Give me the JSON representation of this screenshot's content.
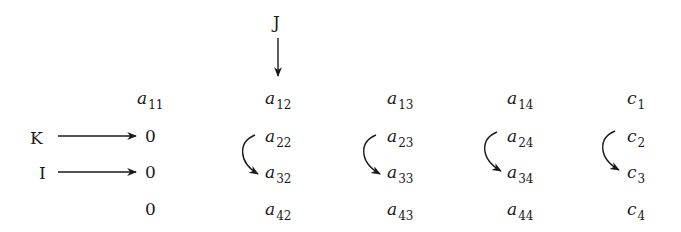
{
  "labels": {
    "J": "J",
    "K": "K",
    "I": "I"
  },
  "matrix": {
    "rows": [
      [
        {
          "base": "a",
          "sub": "11"
        },
        {
          "base": "a",
          "sub": "12"
        },
        {
          "base": "a",
          "sub": "13"
        },
        {
          "base": "a",
          "sub": "14"
        },
        {
          "base": "c",
          "sub": "1"
        }
      ],
      [
        {
          "base": "0",
          "sub": ""
        },
        {
          "base": "a",
          "sub": "22"
        },
        {
          "base": "a",
          "sub": "23"
        },
        {
          "base": "a",
          "sub": "24"
        },
        {
          "base": "c",
          "sub": "2"
        }
      ],
      [
        {
          "base": "0",
          "sub": ""
        },
        {
          "base": "a",
          "sub": "32"
        },
        {
          "base": "a",
          "sub": "33"
        },
        {
          "base": "a",
          "sub": "34"
        },
        {
          "base": "c",
          "sub": "3"
        }
      ],
      [
        {
          "base": "0",
          "sub": ""
        },
        {
          "base": "a",
          "sub": "42"
        },
        {
          "base": "a",
          "sub": "43"
        },
        {
          "base": "a",
          "sub": "44"
        },
        {
          "base": "c",
          "sub": "4"
        }
      ]
    ]
  },
  "arrows": {
    "J_points_to": "a12",
    "K_points_to": "row 2, column 1 zero",
    "I_points_to": "row 3, column 1 zero",
    "swap_arrows": [
      "column 2: row 2 to row 3",
      "column 3: row 2 to row 3",
      "column 4: row 2 to row 3",
      "column 5: row 2 to row 3"
    ]
  },
  "colors": {
    "ink": "#1a1a1a",
    "background": "#ffffff"
  }
}
